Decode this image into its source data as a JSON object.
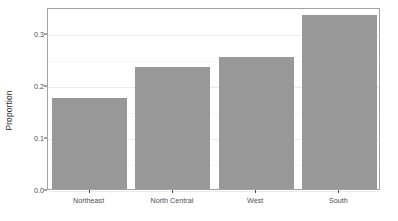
{
  "chart_data": {
    "type": "bar",
    "title": "",
    "subtitle": "",
    "xlabel": "",
    "ylabel": "Proportion",
    "categories": [
      "Northeast",
      "North Central",
      "West",
      "South"
    ],
    "values": [
      0.175,
      0.235,
      0.253,
      0.335
    ],
    "ylim": [
      0.0,
      0.35
    ],
    "ytick_labels": [
      "0.0",
      "0.1",
      "0.2",
      "0.3"
    ],
    "ytick_values": [
      0.0,
      0.1,
      0.2,
      0.3
    ],
    "yminor_values": [
      0.05,
      0.15,
      0.25
    ],
    "grid": true,
    "legend": "none",
    "bar_color": "#989898",
    "panel_background": "#ffffff",
    "panel_border_color": "#a3a3a3",
    "grid_major_color": "#ebebeb",
    "grid_minor_color": "#f5f5f5",
    "axis_text_color": "#4d4d4d",
    "axis_title_color": "#2b2b2b"
  }
}
